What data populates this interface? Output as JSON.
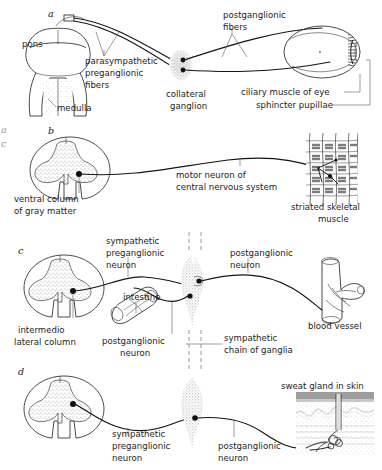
{
  "figure": {
    "background": "#ffffff",
    "ink_color": "#1c1c1c",
    "stipple_color": "#8d8d8d"
  },
  "edge_artifacts": [
    {
      "text": "a",
      "x": 2,
      "y": 132
    },
    {
      "text": "c",
      "x": 2,
      "y": 146
    }
  ],
  "panels": [
    {
      "id": "a",
      "letter": "a",
      "letter_pos": {
        "x": 48,
        "y": 16
      },
      "structures": [
        {
          "name": "pons",
          "label": "pons",
          "x": 22,
          "y": 44
        },
        {
          "name": "medulla",
          "label": "medulla",
          "x": 56,
          "y": 108
        },
        {
          "name": "collateral-ganglion",
          "label": "collateral\nganglion",
          "x": 166,
          "y": 95
        },
        {
          "name": "eye",
          "label": "",
          "x": 320,
          "y": 50
        }
      ],
      "labels": [
        {
          "name": "parasympathetic-preganglionic-fibers",
          "lines": [
            "parasympathetic",
            "preganglionic",
            "fibers"
          ],
          "x": 85,
          "y": 62
        },
        {
          "name": "postganglionic-fibers",
          "lines": [
            "postganglionic",
            "fibers"
          ],
          "x": 223,
          "y": 16
        },
        {
          "name": "collateral-ganglion",
          "lines": [
            "collateral",
            "ganglion"
          ],
          "x": 166,
          "y": 95
        },
        {
          "name": "ciliary-muscle-of-eye",
          "lines": [
            "ciliary muscle of eye"
          ],
          "x": 241,
          "y": 95
        },
        {
          "name": "sphincter-pupillae",
          "lines": [
            "sphincter pupillae"
          ],
          "x": 256,
          "y": 108
        },
        {
          "name": "pons",
          "lines": [
            "pons"
          ],
          "x": 22,
          "y": 44
        },
        {
          "name": "medulla",
          "lines": [
            "medulla"
          ],
          "x": 56,
          "y": 108
        }
      ]
    },
    {
      "id": "b",
      "letter": "b",
      "letter_pos": {
        "x": 48,
        "y": 133
      },
      "labels": [
        {
          "name": "ventral-column-of-gray-matter",
          "lines": [
            "ventral column",
            "of gray matter"
          ],
          "x": 14,
          "y": 199
        },
        {
          "name": "motor-neuron-of-central-nervous-system",
          "lines": [
            "motor neuron of",
            "central nervous system"
          ],
          "x": 176,
          "y": 175
        },
        {
          "name": "striated-skeletal-muscle",
          "lines": [
            "striated skeletal",
            "muscle"
          ],
          "x": 291,
          "y": 207
        }
      ]
    },
    {
      "id": "c",
      "letter": "c",
      "letter_pos": {
        "x": 18,
        "y": 253
      },
      "labels": [
        {
          "name": "sympathetic-preganglionic-neuron",
          "lines": [
            "sympathetic",
            "preganglionic",
            "neuron"
          ],
          "x": 106,
          "y": 241
        },
        {
          "name": "postganglionic-neuron-c",
          "lines": [
            "postganglionic",
            "neuron"
          ],
          "x": 230,
          "y": 253
        },
        {
          "name": "intermediolateral-column",
          "lines": [
            "intermedio",
            "lateral column"
          ],
          "x": 18,
          "y": 330
        },
        {
          "name": "intestine",
          "lines": [
            "intestine"
          ],
          "x": 123,
          "y": 297
        },
        {
          "name": "postganglionic-neuron-intestine",
          "lines": [
            "postganglionic",
            "neuron"
          ],
          "x": 102,
          "y": 341
        },
        {
          "name": "sympathetic-chain-of-ganglia",
          "lines": [
            "sympathetic",
            "chain of ganglia"
          ],
          "x": 224,
          "y": 339
        },
        {
          "name": "blood-vessel",
          "lines": [
            "blood vessel"
          ],
          "x": 308,
          "y": 326
        }
      ]
    },
    {
      "id": "d",
      "letter": "d",
      "letter_pos": {
        "x": 18,
        "y": 374
      },
      "labels": [
        {
          "name": "sympathetic-preganglionic-neuron-d",
          "lines": [
            "sympathetic",
            "preganglionic",
            "neuron"
          ],
          "x": 112,
          "y": 434
        },
        {
          "name": "postganglionic-neuron-d",
          "lines": [
            "postganglionic",
            "neuron"
          ],
          "x": 218,
          "y": 446
        },
        {
          "name": "sweat-gland-in-skin",
          "lines": [
            "sweat gland in skin"
          ],
          "x": 281,
          "y": 386
        }
      ]
    }
  ]
}
